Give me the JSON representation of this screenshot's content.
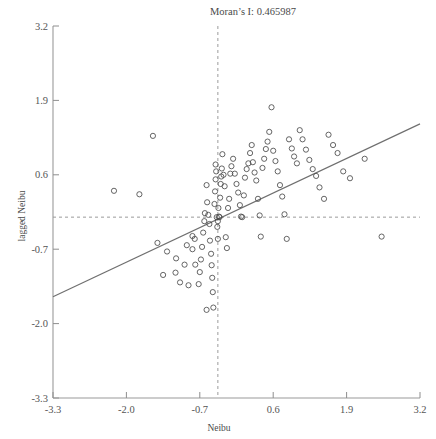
{
  "chart_data": {
    "type": "scatter",
    "title": "Moran’s I: 0.465987",
    "moran_i_label": "Moran’s I:",
    "moran_i_value": "0.465987",
    "xlabel": "Neibu",
    "ylabel": "lagged Neibu",
    "xlim": [
      -3.3,
      3.2
    ],
    "ylim": [
      -3.3,
      3.2
    ],
    "xticks": [
      "-3.3",
      "-2.0",
      "-0.7",
      "0.6",
      "1.9",
      "3.2"
    ],
    "xtick_values": [
      -3.3,
      -2.0,
      -0.7,
      0.6,
      1.9,
      3.2
    ],
    "yticks": [
      "3.2",
      "1.9",
      "0.6",
      "-0.7",
      "-2.0",
      "-3.3"
    ],
    "ytick_values": [
      3.2,
      1.9,
      0.6,
      -0.7,
      -2.0,
      -3.3
    ],
    "grid": false,
    "legend": "none",
    "mean_reference_lines": {
      "vertical_x": -0.38,
      "horizontal_y": -0.14,
      "style": "dashed"
    },
    "fit_line": {
      "slope": 0.466,
      "x_start": -3.3,
      "y_start": -1.53,
      "x_end": 3.2,
      "y_end": 1.49,
      "style": "solid"
    },
    "marker": {
      "shape": "circle-open",
      "radius_px": 2.6,
      "stroke": "#4a4a4a"
    },
    "points": [
      [
        -1.53,
        1.28
      ],
      [
        -2.22,
        0.32
      ],
      [
        -1.77,
        0.26
      ],
      [
        -1.45,
        -0.59
      ],
      [
        -1.28,
        -0.74
      ],
      [
        -1.12,
        -0.86
      ],
      [
        -0.93,
        -0.63
      ],
      [
        -0.83,
        -0.7
      ],
      [
        -0.83,
        -0.47
      ],
      [
        -0.79,
        -0.52
      ],
      [
        -0.78,
        -0.97
      ],
      [
        -0.97,
        -0.97
      ],
      [
        -1.13,
        -1.11
      ],
      [
        -1.35,
        -1.15
      ],
      [
        -1.05,
        -1.28
      ],
      [
        -0.9,
        -1.33
      ],
      [
        -0.72,
        -1.31
      ],
      [
        -0.7,
        -1.1
      ],
      [
        -0.68,
        -0.88
      ],
      [
        -0.66,
        -0.66
      ],
      [
        -0.64,
        -0.41
      ],
      [
        -0.62,
        -0.21
      ],
      [
        -0.61,
        -0.07
      ],
      [
        -0.58,
        0.42
      ],
      [
        -0.57,
        0.12
      ],
      [
        -0.55,
        -0.1
      ],
      [
        -0.53,
        -0.26
      ],
      [
        -0.52,
        -0.55
      ],
      [
        -0.5,
        -0.78
      ],
      [
        -0.49,
        -0.98
      ],
      [
        -0.48,
        -1.2
      ],
      [
        -0.47,
        -1.45
      ],
      [
        -0.46,
        -1.72
      ],
      [
        -0.58,
        -1.76
      ],
      [
        -0.44,
        0.09
      ],
      [
        -0.43,
        0.31
      ],
      [
        -0.42,
        0.52
      ],
      [
        -0.41,
        0.66
      ],
      [
        -0.42,
        0.78
      ],
      [
        -0.4,
        -0.14
      ],
      [
        -0.39,
        -0.31
      ],
      [
        -0.38,
        -0.52
      ],
      [
        -0.38,
        -0.21
      ],
      [
        -0.37,
        0.02
      ],
      [
        -0.36,
        -0.13
      ],
      [
        -0.35,
        -0.14
      ],
      [
        -0.34,
        0.2
      ],
      [
        -0.33,
        0.44
      ],
      [
        -0.32,
        0.57
      ],
      [
        -0.31,
        0.71
      ],
      [
        -0.3,
        0.96
      ],
      [
        -0.28,
        0.6
      ],
      [
        -0.26,
        0.4
      ],
      [
        -0.24,
        -0.49
      ],
      [
        -0.22,
        -0.68
      ],
      [
        -0.2,
        0.02
      ],
      [
        -0.18,
        0.18
      ],
      [
        -0.16,
        0.62
      ],
      [
        -0.14,
        0.75
      ],
      [
        -0.11,
        0.88
      ],
      [
        -0.08,
        0.62
      ],
      [
        -0.05,
        0.44
      ],
      [
        -0.02,
        0.29
      ],
      [
        0.01,
        0.07
      ],
      [
        0.03,
        -0.13
      ],
      [
        0.05,
        -0.14
      ],
      [
        0.08,
        0.24
      ],
      [
        0.1,
        0.55
      ],
      [
        0.13,
        0.7
      ],
      [
        0.16,
        0.8
      ],
      [
        0.19,
        0.98
      ],
      [
        0.22,
        1.12
      ],
      [
        0.24,
        0.82
      ],
      [
        0.27,
        0.64
      ],
      [
        0.3,
        0.5
      ],
      [
        0.33,
        0.18
      ],
      [
        0.36,
        -0.11
      ],
      [
        0.38,
        -0.48
      ],
      [
        0.41,
        0.72
      ],
      [
        0.44,
        0.88
      ],
      [
        0.47,
        1.05
      ],
      [
        0.5,
        1.18
      ],
      [
        0.53,
        1.35
      ],
      [
        0.57,
        1.78
      ],
      [
        0.6,
        1.02
      ],
      [
        0.64,
        0.84
      ],
      [
        0.68,
        0.66
      ],
      [
        0.72,
        0.42
      ],
      [
        0.76,
        0.22
      ],
      [
        0.8,
        -0.09
      ],
      [
        0.84,
        -0.52
      ],
      [
        0.88,
        1.22
      ],
      [
        0.93,
        1.06
      ],
      [
        0.97,
        0.92
      ],
      [
        1.02,
        0.8
      ],
      [
        1.07,
        1.38
      ],
      [
        1.12,
        1.22
      ],
      [
        1.18,
        1.04
      ],
      [
        1.24,
        0.86
      ],
      [
        1.3,
        0.7
      ],
      [
        1.36,
        0.58
      ],
      [
        1.42,
        0.38
      ],
      [
        1.5,
        0.18
      ],
      [
        1.58,
        1.3
      ],
      [
        1.66,
        1.12
      ],
      [
        1.74,
        0.98
      ],
      [
        1.84,
        0.66
      ],
      [
        1.96,
        0.54
      ],
      [
        2.22,
        0.88
      ],
      [
        2.52,
        -0.48
      ]
    ]
  }
}
